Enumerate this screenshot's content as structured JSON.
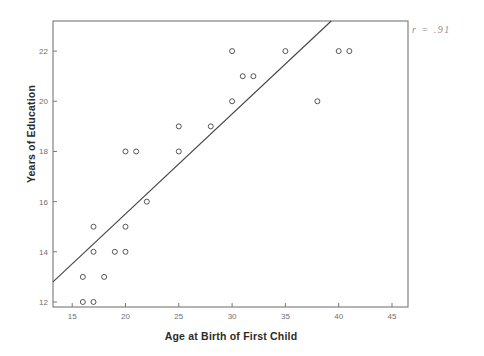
{
  "chart_data": {
    "type": "scatter",
    "title": "",
    "xlabel": "Age at Birth of First Child",
    "ylabel": "Years of Education",
    "xlim": [
      13.2,
      46.5
    ],
    "ylim": [
      11.8,
      23.2
    ],
    "xticks": [
      15,
      20,
      25,
      30,
      35,
      40,
      45
    ],
    "yticks": [
      12,
      14,
      16,
      18,
      20,
      22
    ],
    "grid": false,
    "legend": null,
    "annotations": [
      {
        "text": "r = .91",
        "position": "top-right"
      }
    ],
    "points": [
      {
        "x": 16,
        "y": 12
      },
      {
        "x": 17,
        "y": 12
      },
      {
        "x": 16,
        "y": 13
      },
      {
        "x": 18,
        "y": 13
      },
      {
        "x": 17,
        "y": 14
      },
      {
        "x": 19,
        "y": 14
      },
      {
        "x": 20,
        "y": 14
      },
      {
        "x": 17,
        "y": 15
      },
      {
        "x": 20,
        "y": 15
      },
      {
        "x": 22,
        "y": 16
      },
      {
        "x": 20,
        "y": 18
      },
      {
        "x": 21,
        "y": 18
      },
      {
        "x": 25,
        "y": 18
      },
      {
        "x": 25,
        "y": 19
      },
      {
        "x": 28,
        "y": 19
      },
      {
        "x": 30,
        "y": 20
      },
      {
        "x": 38,
        "y": 20
      },
      {
        "x": 31,
        "y": 21
      },
      {
        "x": 32,
        "y": 21
      },
      {
        "x": 30,
        "y": 22
      },
      {
        "x": 35,
        "y": 22
      },
      {
        "x": 40,
        "y": 22
      },
      {
        "x": 41,
        "y": 22
      }
    ],
    "fit_line": {
      "label": "regression-line",
      "x_start": 13.2,
      "y_start": 12.8,
      "x_end": 39.3,
      "y_end": 23.2
    },
    "marker": {
      "shape": "open-circle",
      "color": "#555555",
      "size": 5
    },
    "colors": {
      "axis": "#777777",
      "line": "#444444",
      "text": "#2b2b2b",
      "tick_text": "#6f6f6f",
      "annotation": "#8d8d8d",
      "background": "#ffffff"
    }
  }
}
